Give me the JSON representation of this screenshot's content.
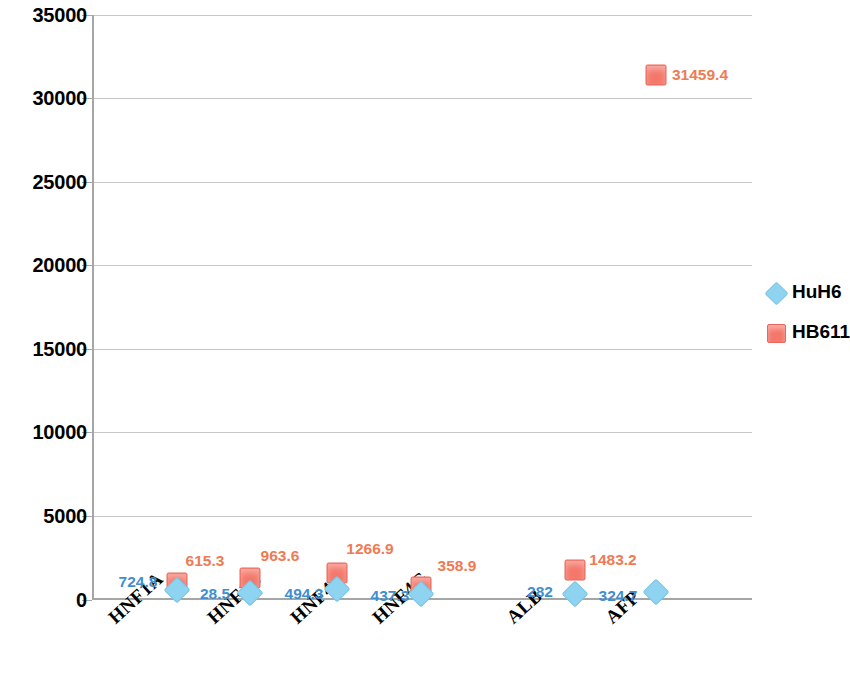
{
  "chart_data": {
    "type": "scatter",
    "title": "",
    "xlabel": "",
    "ylabel": "",
    "categories": [
      "HNF1A",
      "HNF1B",
      "HNF4A",
      "HNF4G",
      "ALB",
      "AFP"
    ],
    "ylim": [
      0,
      35000
    ],
    "yticks": [
      0,
      5000,
      10000,
      15000,
      20000,
      25000,
      30000,
      35000
    ],
    "ytick_labels": [
      "0",
      "5000",
      "10000",
      "15000",
      "20000",
      "25000",
      "30000",
      "35000"
    ],
    "grid": true,
    "legend_position": "right",
    "series": [
      {
        "name": "HuH6",
        "color": "#8ed3ef",
        "marker": "diamond",
        "values": [
          724.8,
          28.5,
          494.3,
          437.3,
          282,
          324.7
        ],
        "value_labels": [
          "724.8",
          "28.5",
          "494.3",
          "437.3",
          "282",
          "324.7"
        ]
      },
      {
        "name": "HB611",
        "color": "#f4776a",
        "marker": "square",
        "values": [
          615.3,
          963.6,
          1266.9,
          358.9,
          1483.2,
          31459.4
        ],
        "value_labels": [
          "615.3",
          "963.6",
          "1266.9",
          "358.9",
          "1483.2",
          "31459.4"
        ]
      }
    ]
  },
  "axis": {
    "y_ticks": [
      {
        "label": "35000",
        "top": 15
      },
      {
        "label": "30000",
        "top": 98
      },
      {
        "label": "25000",
        "top": 182
      },
      {
        "label": "20000",
        "top": 265
      },
      {
        "label": "15000",
        "top": 349
      },
      {
        "label": "10000",
        "top": 432
      },
      {
        "label": "5000",
        "top": 516
      },
      {
        "label": "0",
        "top": 600
      }
    ],
    "x_labels": [
      {
        "text": "HNF1A",
        "left": 104
      },
      {
        "text": "HNF1B",
        "left": 203
      },
      {
        "text": "HNF4A",
        "left": 286
      },
      {
        "text": "HNF4G",
        "left": 368
      },
      {
        "text": "ALB",
        "left": 502
      },
      {
        "text": "AFP",
        "left": 601
      }
    ]
  },
  "markers": [
    {
      "name": "marker-hb611-afp",
      "series": "HB611",
      "shape": "square",
      "left": 656,
      "top": 75
    },
    {
      "name": "marker-hb611-hnf1a",
      "series": "HB611",
      "shape": "square",
      "left": 177,
      "top": 583
    },
    {
      "name": "marker-huh6-hnf1a",
      "series": "HuH6",
      "shape": "diamond",
      "left": 177,
      "top": 590
    },
    {
      "name": "marker-hb611-hnf1b",
      "series": "HB611",
      "shape": "square",
      "left": 250,
      "top": 578
    },
    {
      "name": "marker-huh6-hnf1b",
      "series": "HuH6",
      "shape": "diamond",
      "left": 250,
      "top": 593
    },
    {
      "name": "marker-hb611-hnf4a",
      "series": "HB611",
      "shape": "square",
      "left": 337,
      "top": 573
    },
    {
      "name": "marker-huh6-hnf4a",
      "series": "HuH6",
      "shape": "diamond",
      "left": 337,
      "top": 589
    },
    {
      "name": "marker-hb611-hnf4g",
      "series": "HB611",
      "shape": "square",
      "left": 421,
      "top": 587
    },
    {
      "name": "marker-huh6-hnf4g",
      "series": "HuH6",
      "shape": "diamond",
      "left": 421,
      "top": 594
    },
    {
      "name": "marker-hb611-alb",
      "series": "HB611",
      "shape": "square",
      "left": 575,
      "top": 570
    },
    {
      "name": "marker-huh6-alb",
      "series": "HuH6",
      "shape": "diamond",
      "left": 575,
      "top": 594
    },
    {
      "name": "marker-huh6-afp",
      "series": "HuH6",
      "shape": "diamond",
      "left": 656,
      "top": 592
    }
  ],
  "data_labels": [
    {
      "name": "value-huh6-hnf1a",
      "series": "HuH6",
      "text": "724.8",
      "left": 138,
      "top": 582
    },
    {
      "name": "value-hb611-hnf1a",
      "series": "HB611",
      "text": "615.3",
      "left": 205,
      "top": 561
    },
    {
      "name": "value-huh6-hnf1b",
      "series": "HuH6",
      "text": "28.5",
      "left": 215,
      "top": 594
    },
    {
      "name": "value-hb611-hnf1b",
      "series": "HB611",
      "text": "963.6",
      "left": 280,
      "top": 556
    },
    {
      "name": "value-huh6-hnf4a",
      "series": "HuH6",
      "text": "494.3",
      "left": 304,
      "top": 594
    },
    {
      "name": "value-hb611-hnf4a",
      "series": "HB611",
      "text": "1266.9",
      "left": 370,
      "top": 549
    },
    {
      "name": "value-huh6-hnf4g",
      "series": "HuH6",
      "text": "437.3",
      "left": 390,
      "top": 596
    },
    {
      "name": "value-hb611-hnf4g",
      "series": "HB611",
      "text": "358.9",
      "left": 457,
      "top": 566
    },
    {
      "name": "value-huh6-alb",
      "series": "HuH6",
      "text": "282",
      "left": 540,
      "top": 592
    },
    {
      "name": "value-hb611-alb",
      "series": "HB611",
      "text": "1483.2",
      "left": 613,
      "top": 560
    },
    {
      "name": "value-huh6-afp",
      "series": "HuH6",
      "text": "324.7",
      "left": 618,
      "top": 596
    },
    {
      "name": "value-hb611-afp",
      "series": "HB611",
      "text": "31459.4",
      "left": 700,
      "top": 75
    }
  ],
  "legend": {
    "items": [
      {
        "label": "HuH6",
        "shape": "diamond",
        "color": "#8ed3ef"
      },
      {
        "label": "HB611",
        "shape": "square",
        "color": "#f4776a"
      }
    ]
  }
}
